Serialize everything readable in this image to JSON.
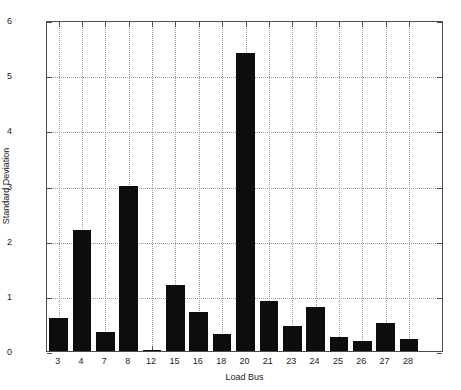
{
  "chart_data": {
    "type": "bar",
    "title": "",
    "subtitle": "",
    "xlabel": "Load Bus",
    "ylabel": "Standard Deviation",
    "categories": [
      "3",
      "4",
      "7",
      "8",
      "12",
      "15",
      "16",
      "18",
      "20",
      "21",
      "23",
      "24",
      "25",
      "26",
      "27",
      "28"
    ],
    "values": [
      0.6,
      2.2,
      0.35,
      3.0,
      0.02,
      1.2,
      0.7,
      0.3,
      5.4,
      0.9,
      0.45,
      0.8,
      0.25,
      0.18,
      0.5,
      0.22
    ],
    "series": [
      {
        "name": "Standard Deviation",
        "values": [
          0.6,
          2.2,
          0.35,
          3.0,
          0.02,
          1.2,
          0.7,
          0.3,
          5.4,
          0.9,
          0.45,
          0.8,
          0.25,
          0.18,
          0.5,
          0.22
        ]
      }
    ],
    "ylim": [
      0,
      6
    ],
    "xlim": [
      0.5,
      17.5
    ],
    "ytick_labels": [
      "0",
      "1",
      "2",
      "3",
      "4",
      "5",
      "6"
    ],
    "ytick_values": [
      0,
      1,
      2,
      3,
      4,
      5,
      6
    ],
    "xtick_labels": [
      "3",
      "4",
      "7",
      "8",
      "12",
      "15",
      "16",
      "18",
      "20",
      "21",
      "23",
      "24",
      "25",
      "26",
      "27",
      "28"
    ],
    "grid": true,
    "grid_style": "dotted",
    "legend": false,
    "legend_position": "none",
    "bar_color": "#0d0d0d",
    "axis_color": "#4d4d4d",
    "grid_color": "#9a9a9a",
    "background_color": "#ffffff",
    "bar_width_fraction": 0.8,
    "annotations": []
  }
}
